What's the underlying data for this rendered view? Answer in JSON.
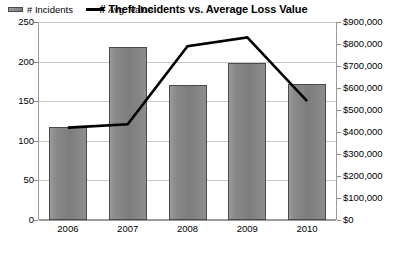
{
  "chart_data": {
    "type": "bar",
    "title": "# Theft Incidents vs. Average Loss Value",
    "categories": [
      "2006",
      "2007",
      "2008",
      "2009",
      "2010"
    ],
    "xlabel": "",
    "grid": true,
    "legend_position": "top-left",
    "series": [
      {
        "name": "# Incidents",
        "type": "bar",
        "axis": "left",
        "color": "#808080",
        "values": [
          118,
          218,
          171,
          198,
          172
        ]
      },
      {
        "name": "Avg. Value",
        "type": "line",
        "axis": "right",
        "color": "#000000",
        "values": [
          420000,
          435000,
          790000,
          830000,
          540000
        ]
      }
    ],
    "left_axis": {
      "label": "",
      "ylim": [
        0,
        250
      ],
      "ticks": [
        0,
        50,
        100,
        150,
        200,
        250
      ],
      "ticklabels": [
        "0",
        "50",
        "100",
        "150",
        "200",
        "250"
      ]
    },
    "right_axis": {
      "label": "",
      "ylim": [
        0,
        900000
      ],
      "ticks": [
        0,
        100000,
        200000,
        300000,
        400000,
        500000,
        600000,
        700000,
        800000,
        900000
      ],
      "ticklabels": [
        "$0",
        "$100,000",
        "$200,000",
        "$300,000",
        "$400,000",
        "$500,000",
        "$600,000",
        "$700,000",
        "$800,000",
        "$900,000"
      ]
    },
    "legend": [
      {
        "label": "# Incidents",
        "marker": "bar-swatch"
      },
      {
        "label": "Avg. Value",
        "marker": "line-swatch"
      }
    ]
  }
}
